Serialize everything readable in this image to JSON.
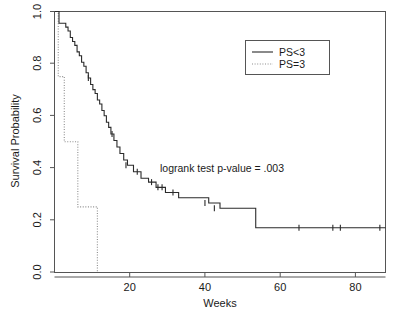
{
  "chart_data": {
    "type": "line",
    "title": "",
    "xlabel": "Weeks",
    "ylabel": "Survival Probability",
    "xlim": [
      0,
      88
    ],
    "ylim": [
      0,
      1.0
    ],
    "xticks": [
      20,
      40,
      60,
      80
    ],
    "xticklabels": [
      "20",
      "40",
      "60",
      "80"
    ],
    "yticks": [
      0.0,
      0.2,
      0.4,
      0.6,
      0.8,
      1.0
    ],
    "yticklabels": [
      "0.0",
      "0.2",
      "0.4",
      "0.6",
      "0.8",
      "1.0"
    ],
    "grid": false,
    "legend_position": "top-right",
    "series": [
      {
        "name": "PS<3",
        "linestyle": "solid",
        "color": "#2b2b2b",
        "x": [
          0,
          1.2,
          1.2,
          3.0,
          3.0,
          3.6,
          3.6,
          4.2,
          4.2,
          4.8,
          4.8,
          5.4,
          5.4,
          6.0,
          6.0,
          6.6,
          6.6,
          7.2,
          7.2,
          7.8,
          7.8,
          8.4,
          8.4,
          9.0,
          9.0,
          9.6,
          9.6,
          10.2,
          10.2,
          10.8,
          10.8,
          11.4,
          11.4,
          12.0,
          12.0,
          12.6,
          12.6,
          13.2,
          13.2,
          13.8,
          13.8,
          14.4,
          14.4,
          15.0,
          15.0,
          15.8,
          15.8,
          16.6,
          16.6,
          17.4,
          17.4,
          18.4,
          18.4,
          19.4,
          19.4,
          21.0,
          21.0,
          23.0,
          23.0,
          25.0,
          25.0,
          27.0,
          27.0,
          29.5,
          29.5,
          33.0,
          33.0,
          41.0,
          41.0,
          44.0,
          44.0,
          53.5,
          53.5,
          88.0
        ],
        "y": [
          1.0,
          1.0,
          0.955,
          0.955,
          0.94,
          0.94,
          0.925,
          0.925,
          0.9,
          0.9,
          0.885,
          0.885,
          0.87,
          0.87,
          0.845,
          0.845,
          0.83,
          0.83,
          0.805,
          0.805,
          0.79,
          0.79,
          0.765,
          0.765,
          0.745,
          0.745,
          0.72,
          0.72,
          0.7,
          0.7,
          0.685,
          0.685,
          0.66,
          0.66,
          0.645,
          0.645,
          0.62,
          0.62,
          0.6,
          0.6,
          0.575,
          0.575,
          0.555,
          0.555,
          0.53,
          0.53,
          0.505,
          0.505,
          0.48,
          0.48,
          0.455,
          0.455,
          0.43,
          0.43,
          0.41,
          0.41,
          0.385,
          0.385,
          0.36,
          0.36,
          0.345,
          0.345,
          0.325,
          0.325,
          0.305,
          0.305,
          0.285,
          0.285,
          0.265,
          0.265,
          0.245,
          0.245,
          0.17,
          0.17
        ],
        "censored_points": [
          {
            "x": 9.0,
            "y": 0.745
          },
          {
            "x": 15.3,
            "y": 0.53
          },
          {
            "x": 19.0,
            "y": 0.41
          },
          {
            "x": 22.0,
            "y": 0.385
          },
          {
            "x": 25.8,
            "y": 0.345
          },
          {
            "x": 27.5,
            "y": 0.325
          },
          {
            "x": 28.6,
            "y": 0.325
          },
          {
            "x": 31.5,
            "y": 0.305
          },
          {
            "x": 40.0,
            "y": 0.265
          },
          {
            "x": 42.5,
            "y": 0.245
          },
          {
            "x": 65.0,
            "y": 0.17
          },
          {
            "x": 74.0,
            "y": 0.17
          },
          {
            "x": 76.0,
            "y": 0.17
          },
          {
            "x": 86.5,
            "y": 0.17
          }
        ]
      },
      {
        "name": "PS=3",
        "linestyle": "dotted",
        "color": "#8d8d8d",
        "x": [
          0,
          1.0,
          1.0,
          2.6,
          2.6,
          6.2,
          6.2,
          11.4,
          11.4
        ],
        "y": [
          1.0,
          1.0,
          0.75,
          0.75,
          0.5,
          0.5,
          0.25,
          0.25,
          0.0
        ],
        "censored_points": []
      }
    ],
    "annotations": [
      {
        "name": "logrank-annotation",
        "text": "logrank test p-value = .003",
        "x": 36.0,
        "y": 0.4
      }
    ],
    "legend": {
      "entries": [
        {
          "label": "PS<3",
          "linestyle": "solid"
        },
        {
          "label": "PS=3",
          "linestyle": "dotted"
        }
      ]
    }
  }
}
